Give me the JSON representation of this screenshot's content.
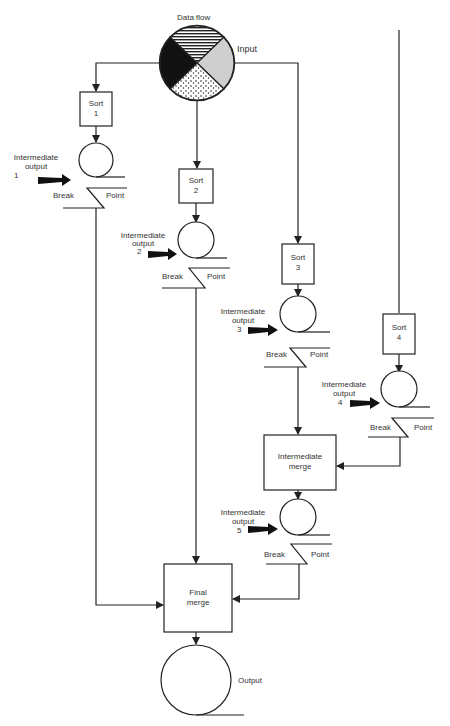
{
  "title": "Data flow",
  "input_label": "Input",
  "output_label": "Output",
  "colors": {
    "line": "#222222",
    "background": "#ffffff",
    "pie_gray": "#cfcfcf"
  },
  "sorts": [
    {
      "line1": "Sort",
      "line2": "1"
    },
    {
      "line1": "Sort",
      "line2": "2"
    },
    {
      "line1": "Sort",
      "line2": "3"
    },
    {
      "line1": "Sort",
      "line2": "4"
    }
  ],
  "intermediate_outputs": [
    {
      "line1": "Intermediate",
      "line2": "output",
      "num": "1"
    },
    {
      "line1": "Intermediate",
      "line2": "output",
      "num": "2"
    },
    {
      "line1": "Intermediate",
      "line2": "output",
      "num": "3"
    },
    {
      "line1": "Intermediate",
      "line2": "output",
      "num": "4"
    },
    {
      "line1": "Intermediate",
      "line2": "output",
      "num": "5"
    }
  ],
  "break_label": "Break",
  "point_label": "Point",
  "intermediate_merge": {
    "line1": "Intermediate",
    "line2": "merge"
  },
  "final_merge": {
    "line1": "Final",
    "line2": "merge"
  }
}
